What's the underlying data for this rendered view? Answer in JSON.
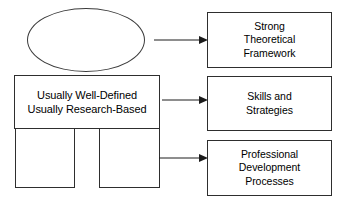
{
  "diagram": {
    "stroke_color": "#2e2e2e",
    "ellipse_stroke_color": "#3b3b3b",
    "background_color": "#ffffff",
    "text_color": "#000000",
    "left_cluster": {
      "ellipse": {
        "label": "",
        "shape": "ellipse"
      },
      "main_box": {
        "label": "Usually Well-Defined\nUsually Research-Based",
        "shape": "rectangle"
      },
      "sub_box_left": {
        "label": "",
        "shape": "rectangle"
      },
      "sub_box_right": {
        "label": "",
        "shape": "rectangle"
      }
    },
    "arrows": [
      {
        "name": "arrow-to-strong-theoretical-framework",
        "direction": "right"
      },
      {
        "name": "arrow-to-skills-and-strategies",
        "direction": "right"
      },
      {
        "name": "arrow-to-professional-development-processes",
        "direction": "right"
      }
    ],
    "outcomes": [
      {
        "label": "Strong\nTheoretical\nFramework"
      },
      {
        "label": "Skills and\nStrategies"
      },
      {
        "label": "Professional\nDevelopment\nProcesses"
      }
    ]
  }
}
